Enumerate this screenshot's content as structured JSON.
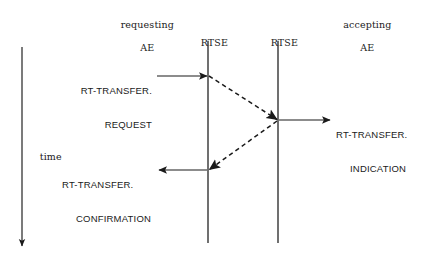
{
  "diagram": {
    "background_color": "#ffffff",
    "line_color": "#1a1a1a",
    "lifelines": [
      {
        "name": "requesting-ae",
        "label_line1": "requesting",
        "label_line2": "AE",
        "x": 22
      },
      {
        "name": "rtse-left",
        "label_line1": "RTSE",
        "label_line2": "",
        "x": 208
      },
      {
        "name": "rtse-right",
        "label_line1": "RTSE",
        "label_line2": "",
        "x": 278
      },
      {
        "name": "accepting-ae",
        "label_line1": "accepting",
        "label_line2": "AE",
        "x": 360
      }
    ],
    "time_axis": {
      "label": "time",
      "direction": "downward"
    },
    "messages": [
      {
        "name": "rt-transfer-request",
        "line1": "RT-TRANSFER.",
        "line2": "REQUEST",
        "style": "solid",
        "direction": "right",
        "from": "requesting-ae",
        "to": "rtse-left"
      },
      {
        "name": "rtse-peer-transfer-down",
        "line1": "",
        "line2": "",
        "style": "dashed",
        "direction": "right-down",
        "from": "rtse-left",
        "to": "rtse-right"
      },
      {
        "name": "rt-transfer-indication",
        "line1": "RT-TRANSFER.",
        "line2": "INDICATION",
        "style": "solid",
        "direction": "right",
        "from": "rtse-right",
        "to": "accepting-ae"
      },
      {
        "name": "rtse-peer-transfer-up",
        "line1": "",
        "line2": "",
        "style": "dashed",
        "direction": "left-down",
        "from": "rtse-right",
        "to": "rtse-left"
      },
      {
        "name": "rt-transfer-confirmation",
        "line1": "RT-TRANSFER.",
        "line2": "CONFIRMATION",
        "style": "solid",
        "direction": "left",
        "from": "rtse-left",
        "to": "requesting-ae"
      }
    ]
  }
}
